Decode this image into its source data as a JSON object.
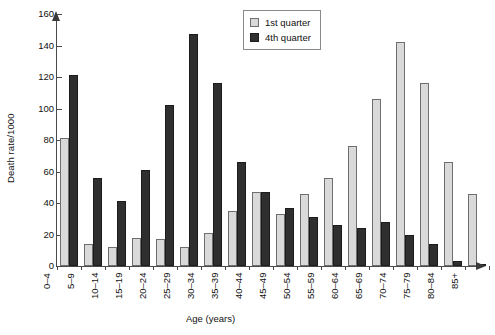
{
  "chart_data": {
    "type": "bar",
    "title": "",
    "xlabel": "Age (years)",
    "ylabel": "Death rate/1000",
    "ylim": [
      0,
      160
    ],
    "ytick_step": 20,
    "yticks": [
      0,
      20,
      40,
      60,
      80,
      100,
      120,
      140,
      160
    ],
    "grid": false,
    "legend_position": "top-right",
    "categories": [
      "0–4",
      "5–9",
      "10–14",
      "15–19",
      "20–24",
      "25–29",
      "30–34",
      "35–39",
      "40–44",
      "45–49",
      "50–54",
      "55–59",
      "60–64",
      "65–69",
      "70–74",
      "75–79",
      "80–84",
      "85+"
    ],
    "series": [
      {
        "name": "1st quarter",
        "color": "#d9d9d9",
        "values": [
          81,
          14,
          12,
          18,
          17,
          12,
          21,
          35,
          47,
          33,
          46,
          56,
          76,
          106,
          142,
          116,
          66,
          46
        ]
      },
      {
        "name": "4th quarter",
        "color": "#2f2f2f",
        "values": [
          121,
          56,
          41,
          61,
          102,
          147,
          116,
          66,
          47,
          37,
          31,
          26,
          24,
          28,
          20,
          14,
          3,
          1
        ]
      }
    ]
  },
  "legend": {
    "items": [
      {
        "label": "1st quarter",
        "swatch": "q1"
      },
      {
        "label": "4th quarter",
        "swatch": "q4"
      }
    ]
  },
  "axes": {
    "y_label": "Death rate/1000",
    "x_label": "Age (years)"
  }
}
